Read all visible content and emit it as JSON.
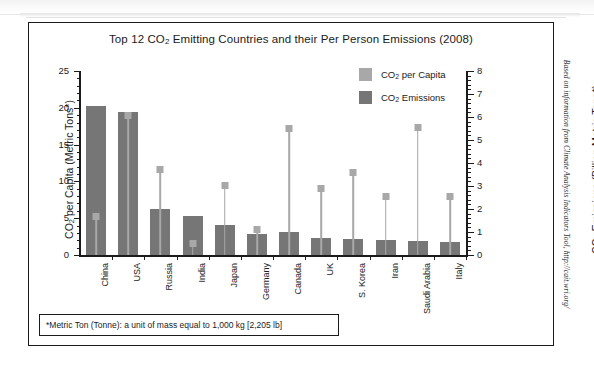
{
  "title": "Top 12 CO2 Emitting Countries and their Per Person Emissions (2008)",
  "title_parts": {
    "pre": "Top 12 CO",
    "sub": "2",
    "post": " Emitting Countries and their Per Person Emissions (2008)"
  },
  "legend": {
    "items": [
      {
        "label_pre": "CO",
        "label_sub": "2",
        "label_post": " per Capita",
        "label": "CO2 per Capita",
        "color": "#a8a8a8"
      },
      {
        "label_pre": "CO",
        "label_sub": "2",
        "label_post": " Emissions",
        "label": "CO2 Emissions",
        "color": "#767676"
      }
    ]
  },
  "footnote": "*Metric Ton (Tonne): a unit of mass equal to 1,000 kg [2,205 lb]",
  "source_credit": "Based on information from Climate Analysis Indicators Tool, http://cait.wri.org/",
  "axes": {
    "left": {
      "title_pre": "CO",
      "title_sub": "2",
      "title_post": " per Capita (Metric Tons*)",
      "title": "CO2 per Capita (Metric Tons*)",
      "ticks": [
        "0",
        "5",
        "10",
        "15",
        "20",
        "25"
      ],
      "min": 0,
      "max": 25,
      "minor_step": 1
    },
    "right": {
      "title_pre": "CO",
      "title_sub": "2",
      "title_post": " Emissions (Billion Metric Tons*)",
      "title": "CO2 Emissions (Billion Metric Tons*)",
      "ticks": [
        "0",
        "1",
        "2",
        "3",
        "4",
        "5",
        "6",
        "7",
        "8"
      ],
      "min": 0,
      "max": 8,
      "minor_step": 0.2
    }
  },
  "chart_data": {
    "type": "bar",
    "title": "Top 12 CO2 Emitting Countries and their Per Person Emissions (2008)",
    "xlabel": "",
    "ylabel": "CO2 per Capita (Metric Tons*)",
    "ylabel_secondary": "CO2 Emissions (Billion Metric Tons*)",
    "ylim": [
      0,
      25
    ],
    "ylim_secondary": [
      0,
      8
    ],
    "grid": false,
    "legend_position": "top-right",
    "categories": [
      "China",
      "USA",
      "Russia",
      "India",
      "Japan",
      "Germany",
      "Canada",
      "UK",
      "S. Korea",
      "Iran",
      "Saudi Arabia",
      "Italy"
    ],
    "series": [
      {
        "name": "CO2 Emissions",
        "axis": "right",
        "unit": "Billion Metric Tons",
        "render": "bar",
        "color": "#767676",
        "values": [
          6.5,
          6.2,
          2.0,
          1.7,
          1.3,
          0.9,
          1.0,
          0.75,
          0.7,
          0.65,
          0.6,
          0.55
        ]
      },
      {
        "name": "CO2 per Capita",
        "axis": "left",
        "unit": "Metric Tons",
        "render": "marker",
        "color": "#a8a8a8",
        "values": [
          5.3,
          19.0,
          11.6,
          1.5,
          9.5,
          3.5,
          17.2,
          9.0,
          11.2,
          8.0,
          17.3,
          7.9
        ]
      }
    ]
  }
}
